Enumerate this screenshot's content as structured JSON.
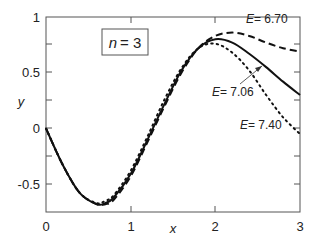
{
  "chart_data": {
    "type": "line",
    "title": "",
    "xlabel": "x",
    "ylabel": "y",
    "xlim": [
      0,
      3
    ],
    "ylim": [
      -0.75,
      1
    ],
    "xticks": [
      "0",
      "1",
      "2",
      "3"
    ],
    "yticks": [
      "-0.5",
      "0",
      "0.5",
      "1"
    ],
    "grid": false,
    "legend": "none",
    "annotation_box": "n = 3",
    "series": [
      {
        "name": "E = 6.70",
        "style": "dashed",
        "x": [
          0,
          0.2,
          0.4,
          0.6,
          0.7,
          0.8,
          1.0,
          1.2,
          1.4,
          1.6,
          1.8,
          2.0,
          2.2,
          2.4,
          2.6,
          2.8,
          3.0
        ],
        "y": [
          0,
          -0.33,
          -0.58,
          -0.68,
          -0.68,
          -0.64,
          -0.43,
          -0.12,
          0.2,
          0.5,
          0.72,
          0.83,
          0.86,
          0.83,
          0.77,
          0.72,
          0.69
        ]
      },
      {
        "name": "E = 7.06",
        "style": "solid",
        "x": [
          0,
          0.2,
          0.4,
          0.6,
          0.7,
          0.8,
          1.0,
          1.2,
          1.4,
          1.6,
          1.8,
          2.0,
          2.2,
          2.4,
          2.6,
          2.8,
          3.0
        ],
        "y": [
          0,
          -0.33,
          -0.58,
          -0.68,
          -0.67,
          -0.62,
          -0.41,
          -0.1,
          0.22,
          0.52,
          0.72,
          0.8,
          0.77,
          0.67,
          0.55,
          0.42,
          0.3
        ]
      },
      {
        "name": "E = 7.40",
        "style": "dotted",
        "x": [
          0,
          0.2,
          0.4,
          0.6,
          0.7,
          0.8,
          1.0,
          1.2,
          1.4,
          1.6,
          1.8,
          2.0,
          2.2,
          2.4,
          2.6,
          2.8,
          3.0
        ],
        "y": [
          0,
          -0.33,
          -0.58,
          -0.67,
          -0.65,
          -0.6,
          -0.38,
          -0.07,
          0.26,
          0.54,
          0.72,
          0.76,
          0.68,
          0.52,
          0.3,
          0.1,
          -0.05
        ]
      }
    ],
    "annotations": [
      {
        "text": "E = 6.70",
        "x": 2.45,
        "y": 0.86
      },
      {
        "text": "E = 7.06",
        "x": 2.0,
        "y": 0.47,
        "arrow_to": [
          2.55,
          0.57
        ]
      },
      {
        "text": "E = 7.40",
        "x": 2.55,
        "y": 0.04
      }
    ]
  },
  "labels": {
    "x_axis": "x",
    "y_axis": "y",
    "box_n": "n",
    "box_eq": "= 3",
    "e_sym": "E",
    "e670": "=  6.70",
    "e706": "=  7.06",
    "e740": "=  7.40",
    "xt0": "0",
    "xt1": "1",
    "xt2": "2",
    "xt3": "3",
    "yt1": "1",
    "yt05": "0.5",
    "yt0": "0",
    "ytm05": "-0.5"
  }
}
